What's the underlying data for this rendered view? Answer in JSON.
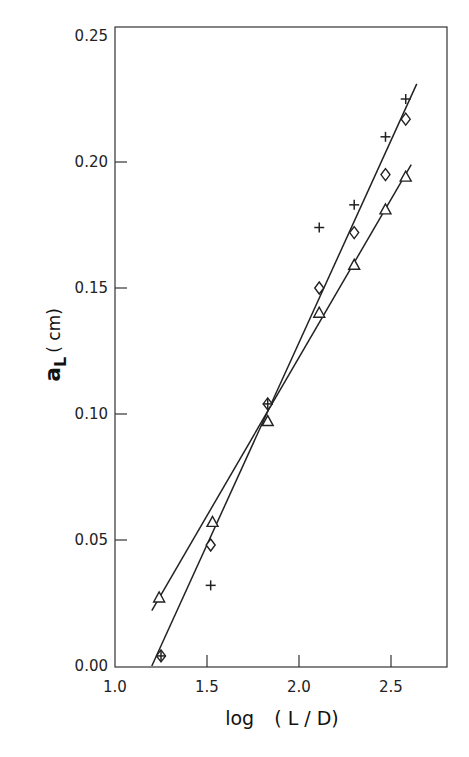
{
  "chart_data": {
    "type": "scatter",
    "title": "",
    "xlabel": "log (L/D)",
    "ylabel": "a_L (cm)",
    "xlim": [
      1.0,
      2.8
    ],
    "ylim": [
      0.0,
      0.25
    ],
    "xticks": [
      1.0,
      1.5,
      2.0,
      2.5
    ],
    "xtick_labels": [
      "1.0",
      "1.5",
      "2.0",
      "2.5"
    ],
    "yticks": [
      0.0,
      0.05,
      0.1,
      0.15,
      0.2,
      0.25
    ],
    "ytick_labels": [
      "0.00",
      "0.05",
      "0.10",
      "0.15",
      "0.20",
      "0.25"
    ],
    "grid": false,
    "legend": null,
    "series": [
      {
        "name": "triangle",
        "marker": "triangle-open",
        "x": [
          1.24,
          1.53,
          1.83,
          2.11,
          2.3,
          2.47,
          2.58
        ],
        "y": [
          0.027,
          0.057,
          0.097,
          0.14,
          0.159,
          0.181,
          0.194
        ]
      },
      {
        "name": "diamond",
        "marker": "diamond-open",
        "x": [
          1.25,
          1.52,
          1.83,
          2.11,
          2.3,
          2.47,
          2.58
        ],
        "y": [
          0.004,
          0.048,
          0.104,
          0.15,
          0.172,
          0.195,
          0.217
        ]
      },
      {
        "name": "plus",
        "marker": "plus",
        "x": [
          1.25,
          1.52,
          1.83,
          2.11,
          2.3,
          2.47,
          2.58
        ],
        "y": [
          0.004,
          0.032,
          0.104,
          0.174,
          0.183,
          0.21,
          0.225
        ]
      }
    ],
    "fit_lines": [
      {
        "name": "shallow-fit",
        "x": [
          1.2,
          2.61
        ],
        "y": [
          0.022,
          0.199
        ]
      },
      {
        "name": "steep-fit",
        "x": [
          1.2,
          2.64
        ],
        "y": [
          0.0,
          0.231
        ]
      }
    ]
  },
  "axes": {
    "xlabel_main": "log",
    "xlabel_paren": "( L / D)",
    "ylabel_main": "a",
    "ylabel_sub": "L",
    "ylabel_unit": "( cm)"
  }
}
